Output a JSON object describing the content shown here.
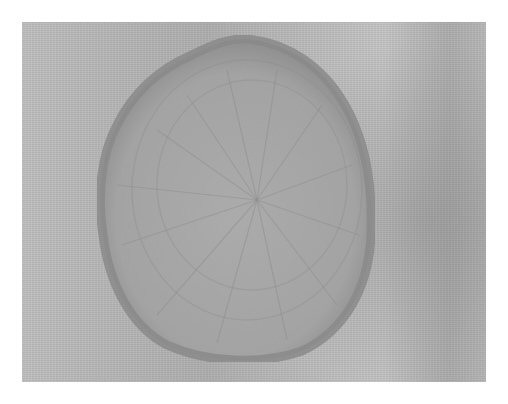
{
  "image": {
    "description": "Grayscale micrograph of an oval, radially patterned specimen on a textured background",
    "colors": {
      "background": "#bdbdbd",
      "specimen_fill": "#a6a6a6",
      "specimen_rim": "#8c8c8c",
      "frame": "#ffffff"
    }
  },
  "caption": ""
}
